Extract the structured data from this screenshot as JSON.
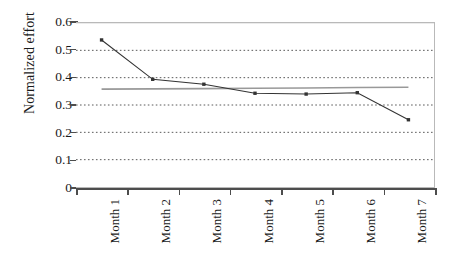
{
  "chart_data": {
    "type": "line",
    "title": "",
    "xlabel": "",
    "ylabel": "Normalized effort",
    "categories": [
      "Month 1",
      "Month 2",
      "Month 3",
      "Month 4",
      "Month 5",
      "Month 6",
      "Month 7"
    ],
    "ylim": [
      0,
      0.6
    ],
    "yticks": [
      "0",
      "0.1",
      "0.2",
      "0.3",
      "0.4",
      "0.5",
      "0.6"
    ],
    "ytick_values": [
      0,
      0.1,
      0.2,
      0.3,
      0.4,
      0.5,
      0.6
    ],
    "grid": "horizontal-dotted",
    "legend": "none",
    "series": [
      {
        "name": "Normalized effort",
        "marker": "square",
        "color": "#333333",
        "values": [
          0.538,
          0.394,
          0.376,
          0.343,
          0.34,
          0.345,
          0.246
        ]
      },
      {
        "name": "Trend line",
        "marker": "none",
        "color": "#999999",
        "values": [
          0.358,
          0.359,
          0.36,
          0.361,
          0.362,
          0.364,
          0.365
        ]
      }
    ]
  },
  "axes": {
    "y_title": "Normalized effort"
  },
  "colors": {
    "series": "#333333",
    "trend": "#999999",
    "grid": "#595959",
    "axis": "#4d4d4d",
    "border": "#b9b9b9",
    "text": "#1a1a1a"
  }
}
